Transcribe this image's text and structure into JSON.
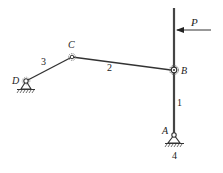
{
  "diagram": {
    "type": "four-bar linkage mechanism",
    "joints": {
      "A": {
        "label": "A",
        "x": 174,
        "y": 135,
        "type": "fixed-pivot"
      },
      "B": {
        "label": "B",
        "x": 174,
        "y": 70,
        "type": "pin-joint"
      },
      "C": {
        "label": "C",
        "x": 72,
        "y": 57,
        "type": "pin-joint"
      },
      "D": {
        "label": "D",
        "x": 26,
        "y": 81,
        "type": "fixed-pivot"
      }
    },
    "links": [
      {
        "label": "1",
        "from": "A",
        "to": "B"
      },
      {
        "label": "2",
        "from": "B",
        "to": "C"
      },
      {
        "label": "3",
        "from": "C",
        "to": "D"
      },
      {
        "label": "4",
        "note": "ground / frame"
      }
    ],
    "force": {
      "label": "P",
      "direction": "left",
      "applied_on": "link 1 extension above B"
    },
    "colors": {
      "line": "#333333",
      "background": "#ffffff"
    }
  }
}
